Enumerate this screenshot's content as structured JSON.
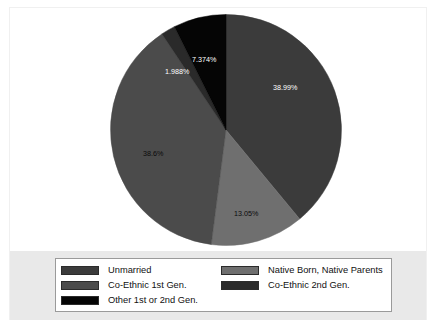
{
  "chart_data": {
    "type": "pie",
    "title": "",
    "subtitle": "",
    "xlabel": "",
    "ylabel": "",
    "grid": false,
    "legend_position": "bottom",
    "start_angle_deg": 0,
    "direction": "clockwise",
    "categories": [
      "Unmarried",
      "Native Born, Native Parents",
      "Co-Ethnic 1st Gen.",
      "Co-Ethnic 2nd Gen.",
      "Other 1st or 2nd Gen."
    ],
    "values": [
      38.99,
      13.05,
      38.6,
      1.988,
      7.374
    ],
    "value_labels": [
      "38.99%",
      "13.05%",
      "38.6%",
      "1.988%",
      "7.374%"
    ],
    "colors": [
      "#3b3b3b",
      "#6f6f6f",
      "#4b4b4b",
      "#2a2a2a",
      "#050505"
    ],
    "slices": [
      {
        "label": "Unmarried",
        "value": 38.99,
        "value_label": "38.99%",
        "color": "#3b3b3b",
        "label_x": 163,
        "label_y": 76,
        "label_color": "light"
      },
      {
        "label": "Native Born, Native Parents",
        "value": 13.05,
        "value_label": "13.05%",
        "color": "#6f6f6f",
        "label_x": 124,
        "label_y": 202,
        "label_color": "dark"
      },
      {
        "label": "Co-Ethnic 1st Gen.",
        "value": 38.6,
        "value_label": "38.6%",
        "color": "#4b4b4b",
        "label_x": 33,
        "label_y": 142,
        "label_color": "dark"
      },
      {
        "label": "Co-Ethnic 2nd Gen.",
        "value": 1.988,
        "value_label": "1.988%",
        "color": "#2a2a2a",
        "label_x": 55,
        "label_y": 60,
        "label_color": "light"
      },
      {
        "label": "Other 1st or 2nd Gen.",
        "value": 7.374,
        "value_label": "7.374%",
        "color": "#050505",
        "label_x": 82,
        "label_y": 48,
        "label_color": "light"
      }
    ]
  },
  "legend": {
    "entries": [
      {
        "label": "Unmarried",
        "color": "#3b3b3b"
      },
      {
        "label": "Native Born, Native Parents",
        "color": "#6f6f6f"
      },
      {
        "label": "Co-Ethnic 1st Gen.",
        "color": "#4b4b4b"
      },
      {
        "label": "Co-Ethnic 2nd Gen.",
        "color": "#2a2a2a"
      },
      {
        "label": "Other 1st or 2nd Gen.",
        "color": "#050505"
      }
    ]
  },
  "colors": {
    "figure_background": "#ffffff",
    "legend_band_background": "#e9e9e9",
    "legend_box_background": "#ffffff",
    "legend_box_border": "#9a9a9a",
    "frame_border": "#f0f0f0"
  }
}
